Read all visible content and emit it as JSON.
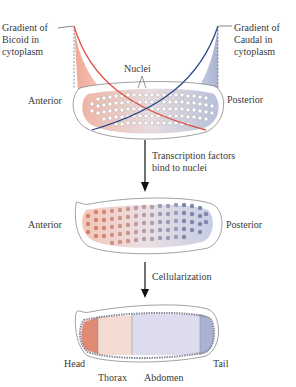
{
  "stage1": {
    "bicoid_label": [
      "Gradient of",
      "Bicoid in",
      "cytoplasm"
    ],
    "caudal_label": [
      "Gradient of",
      "Caudal in",
      "cytoplasm"
    ],
    "nuclei_label": "Nuclei",
    "anterior": "Anterior",
    "posterior": "Posterior"
  },
  "step1": {
    "label": [
      "Transcription factors",
      "bind to nuclei"
    ]
  },
  "stage2": {
    "anterior": "Anterior",
    "posterior": "Posterior"
  },
  "step2": {
    "label": "Cellularization"
  },
  "stage3": {
    "regions": [
      "Head",
      "Thorax",
      "Abdomen",
      "Tail"
    ]
  },
  "colors": {
    "bicoid": "#d9534a",
    "caudal": "#2b4a8a",
    "bicoid_fill": "#f2b5a3",
    "caudal_fill": "#b9c2dc"
  }
}
